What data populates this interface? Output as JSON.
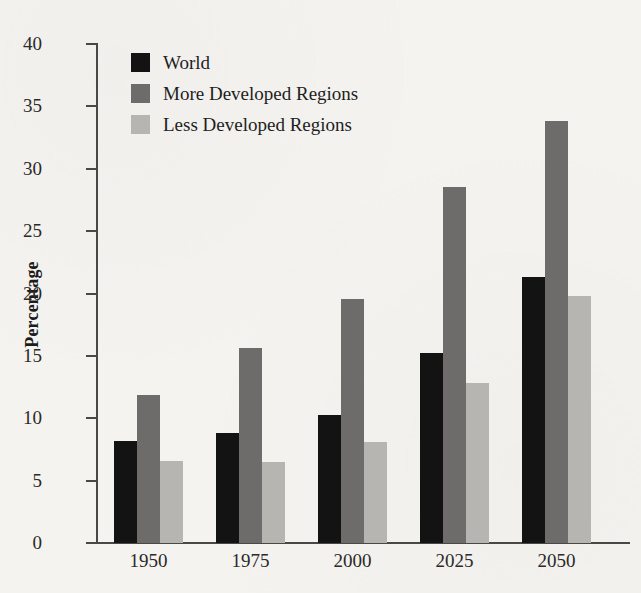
{
  "chart_data": {
    "type": "bar",
    "title": "",
    "subtitle": "",
    "xlabel": "",
    "ylabel": "Percentage",
    "categories": [
      "1950",
      "1975",
      "2000",
      "2025",
      "2050"
    ],
    "series": [
      {
        "name": "World",
        "color": "#131313",
        "values": [
          8.2,
          8.8,
          10.3,
          15.2,
          21.3
        ]
      },
      {
        "name": "More Developed Regions",
        "color": "#6d6c6a",
        "values": [
          11.9,
          15.6,
          19.6,
          28.5,
          33.8
        ]
      },
      {
        "name": "Less Developed Regions",
        "color": "#b6b5b2",
        "values": [
          6.6,
          6.5,
          8.1,
          12.8,
          19.8
        ]
      }
    ],
    "ylim": [
      0,
      40
    ],
    "ytick_values": [
      0,
      5,
      10,
      15,
      20,
      25,
      30,
      35,
      40
    ],
    "ytick_labels": [
      "0",
      "5",
      "10",
      "15",
      "20",
      "25",
      "30",
      "35",
      "40"
    ],
    "grid": false,
    "legend_position": "top-left",
    "annotations": []
  },
  "legend": {
    "entries": [
      {
        "label": "World",
        "swatch_color": "#131313"
      },
      {
        "label": "More Developed Regions",
        "swatch_color": "#6d6c6a"
      },
      {
        "label": "Less Developed Regions",
        "swatch_color": "#b6b5b2"
      }
    ]
  },
  "colors": {
    "background": "#f4f3f0",
    "axis": "#4a4846",
    "text": "#2b2a28"
  }
}
